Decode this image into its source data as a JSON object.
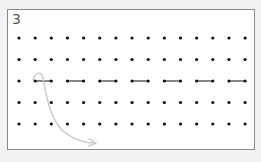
{
  "puzzle": {
    "label": "3",
    "grid": {
      "rows": 5,
      "cols": 15,
      "origin_x": 19,
      "origin_y": 38,
      "dx": 16.15,
      "dy": 21.5,
      "dot_color": "#111111",
      "dot_radius": 1.6
    },
    "segments": [
      {
        "row": 2,
        "from_col": 1,
        "to_col": 2
      },
      {
        "row": 2,
        "from_col": 3,
        "to_col": 4
      },
      {
        "row": 2,
        "from_col": 5,
        "to_col": 6
      },
      {
        "row": 2,
        "from_col": 7,
        "to_col": 8
      },
      {
        "row": 2,
        "from_col": 9,
        "to_col": 10
      },
      {
        "row": 2,
        "from_col": 11,
        "to_col": 12
      },
      {
        "row": 2,
        "from_col": 13,
        "to_col": 14
      }
    ],
    "segment_color": "#444444",
    "arrow": {
      "color": "#c8c8c8",
      "path": "M33,80 C35,72 41,71 43,78 C46,95 50,118 62,130 C72,139 84,143 95,143",
      "head": "M89,139 L96,143 L89,146"
    }
  }
}
